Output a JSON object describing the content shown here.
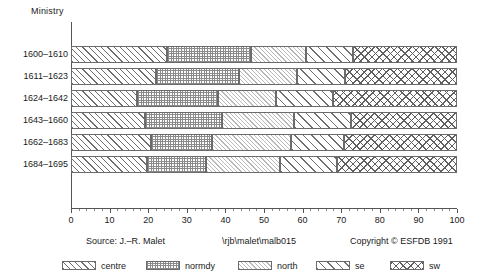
{
  "chart_data": {
    "type": "bar",
    "orientation": "horizontal",
    "stacked": true,
    "normalized_percent": true,
    "title": "",
    "ylabel": "Ministry",
    "xlabel": "",
    "xlim": [
      0,
      100
    ],
    "xticks": [
      0,
      10,
      20,
      30,
      40,
      50,
      60,
      70,
      80,
      90,
      100
    ],
    "xticklabels": [
      "0",
      "10",
      "20",
      "30",
      "40",
      "50",
      "60",
      "70",
      "80",
      "90",
      "100"
    ],
    "grid": false,
    "legend_position": "bottom",
    "categories": [
      "1600-1610",
      "1611-1623",
      "1624-1642",
      "1643-1660",
      "1662-1683",
      "1684-1695"
    ],
    "series": [
      {
        "name": "centre",
        "pattern": "diagonal-hatch-up",
        "values": [
          24.8,
          22.0,
          17.1,
          19.3,
          20.7,
          19.8
        ]
      },
      {
        "name": "normdy",
        "pattern": "fine-crosshatch-grid",
        "values": [
          21.9,
          21.6,
          20.9,
          19.9,
          15.9,
          15.1
        ]
      },
      {
        "name": "north",
        "pattern": "light-diagonal-hatch",
        "values": [
          14.3,
          14.9,
          15.2,
          18.6,
          20.4,
          19.3
        ]
      },
      {
        "name": "se",
        "pattern": "wide-diagonal-hatch",
        "values": [
          12.0,
          12.5,
          14.7,
          14.6,
          13.8,
          14.8
        ]
      },
      {
        "name": "sw",
        "pattern": "diagonal-crosshatch",
        "values": [
          27.0,
          29.0,
          32.1,
          27.5,
          29.2,
          31.0
        ]
      }
    ],
    "boundaries": [
      [
        24.8,
        46.7,
        61.0,
        73.0,
        100
      ],
      [
        22.0,
        43.6,
        58.5,
        71.0,
        100
      ],
      [
        17.1,
        38.0,
        53.2,
        67.9,
        100
      ],
      [
        19.3,
        39.2,
        57.9,
        72.5,
        100
      ],
      [
        20.7,
        36.6,
        57.0,
        70.8,
        100
      ],
      [
        19.8,
        34.9,
        54.2,
        69.0,
        100
      ]
    ]
  },
  "axis": {
    "y_title": "Ministry",
    "y_labels": [
      "1600–1610",
      "1611–1623",
      "1624–1642",
      "1643–1660",
      "1662–1683",
      "1684–1695"
    ],
    "x_labels": [
      "0",
      "10",
      "20",
      "30",
      "40",
      "50",
      "60",
      "70",
      "80",
      "90",
      "100"
    ]
  },
  "legend": {
    "entries": [
      {
        "label": "centre",
        "key": "centre"
      },
      {
        "label": "normdy",
        "key": "normdy"
      },
      {
        "label": "north",
        "key": "north"
      },
      {
        "label": "se",
        "key": "se"
      },
      {
        "label": "sw",
        "key": "sw"
      }
    ]
  },
  "footer": {
    "source": "Source: J.–R. Malet",
    "path": "\\rjb\\malet\\malb015",
    "copyright": "Copyright © ESFDB 1991"
  }
}
